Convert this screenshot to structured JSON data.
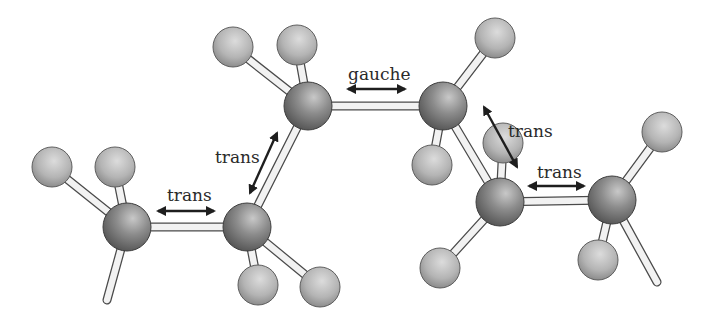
{
  "diagram": {
    "colors": {
      "carbon": "#8a8a8a",
      "hydrogen": "#b8b8b8",
      "bond": "#f2f2f2",
      "bond_outline": "#4a4a4a",
      "arrow": "#1e1e1e",
      "text": "#2a2a2a"
    },
    "carbons": [
      {
        "id": "C1",
        "x": 127,
        "y": 227,
        "r": 24
      },
      {
        "id": "C2",
        "x": 247,
        "y": 227,
        "r": 24
      },
      {
        "id": "C3",
        "x": 308,
        "y": 106,
        "r": 24
      },
      {
        "id": "C4",
        "x": 443,
        "y": 106,
        "r": 24
      },
      {
        "id": "C5",
        "x": 500,
        "y": 202,
        "r": 24
      },
      {
        "id": "C6",
        "x": 612,
        "y": 200,
        "r": 24
      }
    ],
    "hydrogens": [
      {
        "id": "H1a",
        "x": 52,
        "y": 167,
        "r": 20,
        "bonded_to": "C1"
      },
      {
        "id": "H1b",
        "x": 115,
        "y": 167,
        "r": 20,
        "bonded_to": "C1"
      },
      {
        "id": "H2a",
        "x": 258,
        "y": 285,
        "r": 20,
        "bonded_to": "C2"
      },
      {
        "id": "H2b",
        "x": 320,
        "y": 287,
        "r": 20,
        "bonded_to": "C2"
      },
      {
        "id": "H3a",
        "x": 233,
        "y": 47,
        "r": 20,
        "bonded_to": "C3"
      },
      {
        "id": "H3b",
        "x": 297,
        "y": 45,
        "r": 20,
        "bonded_to": "C3"
      },
      {
        "id": "H4a",
        "x": 495,
        "y": 38,
        "r": 20,
        "bonded_to": "C4"
      },
      {
        "id": "H4b",
        "x": 432,
        "y": 165,
        "r": 20,
        "bonded_to": "C4"
      },
      {
        "id": "H5a",
        "x": 503,
        "y": 143,
        "r": 20,
        "bonded_to": "C5"
      },
      {
        "id": "H5b",
        "x": 440,
        "y": 268,
        "r": 20,
        "bonded_to": "C5"
      },
      {
        "id": "H6a",
        "x": 662,
        "y": 132,
        "r": 20,
        "bonded_to": "C6"
      },
      {
        "id": "H6b",
        "x": 598,
        "y": 260,
        "r": 20,
        "bonded_to": "C6"
      }
    ],
    "stubs": [
      {
        "from": "C1",
        "x2": 107,
        "y2": 300
      },
      {
        "from": "C6",
        "x2": 657,
        "y2": 282
      }
    ],
    "torsions": [
      {
        "label": "trans",
        "text_x": 167,
        "text_y": 201,
        "arrow": [
          158,
          211,
          214,
          211
        ]
      },
      {
        "label": "trans",
        "text_x": 215,
        "text_y": 163,
        "arrow": [
          250,
          193,
          277,
          133
        ]
      },
      {
        "label": "gauche",
        "text_x": 348,
        "text_y": 80,
        "arrow": [
          348,
          89,
          405,
          89
        ]
      },
      {
        "label": "trans",
        "text_x": 508,
        "text_y": 137,
        "arrow": [
          484,
          107,
          517,
          167
        ]
      },
      {
        "label": "trans",
        "text_x": 537,
        "text_y": 178,
        "arrow": [
          529,
          186,
          584,
          186
        ]
      }
    ]
  }
}
